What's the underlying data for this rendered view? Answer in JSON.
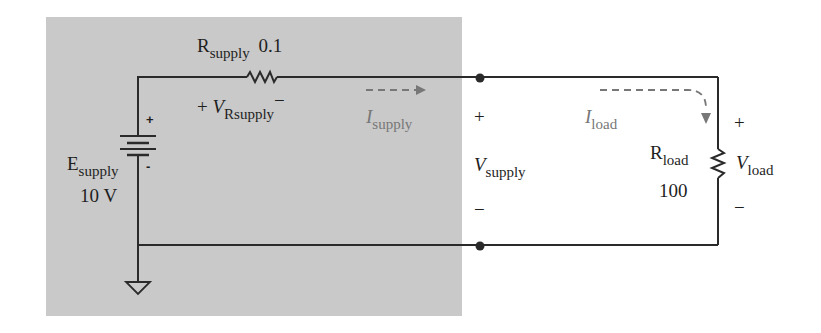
{
  "colors": {
    "shade": "#c9c9c9",
    "wire": "#2a2a2a",
    "current_arrow": "#777777"
  },
  "supply_resistor": {
    "name": "R",
    "sub": "supply",
    "value": "0.1"
  },
  "supply_resistor_voltage": {
    "plus": "+",
    "name": "V",
    "sub": "Rsupply",
    "minus": "−"
  },
  "source": {
    "name": "E",
    "sub": "supply",
    "value": "10 V",
    "plus": "+",
    "minus": "-"
  },
  "supply_current": {
    "name": "I",
    "sub": "supply"
  },
  "supply_voltage": {
    "plus": "+",
    "name": "V",
    "sub": "supply",
    "minus": "−"
  },
  "load_current": {
    "name": "I",
    "sub": "load"
  },
  "load_resistor": {
    "name": "R",
    "sub": "load",
    "value": "100"
  },
  "load_voltage": {
    "plus": "+",
    "name": "V",
    "sub": "load",
    "minus": "−"
  }
}
